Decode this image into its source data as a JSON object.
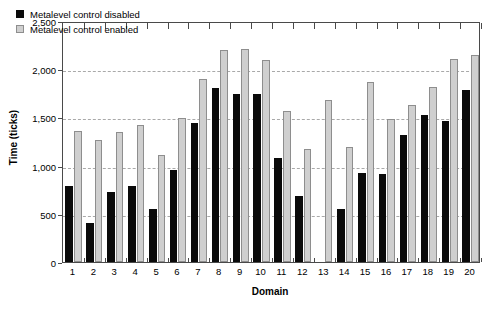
{
  "chart_data": {
    "type": "bar",
    "title": "",
    "xlabel": "Domain",
    "ylabel": "Time (ticks)",
    "categories": [
      "1",
      "2",
      "3",
      "4",
      "5",
      "6",
      "7",
      "8",
      "9",
      "10",
      "11",
      "12",
      "13",
      "14",
      "15",
      "16",
      "17",
      "18",
      "19",
      "20"
    ],
    "ylim": [
      0,
      2500
    ],
    "yticks": [
      0,
      500,
      1000,
      1500,
      2000,
      2500
    ],
    "ytick_labels": [
      "0",
      "500",
      "1,000",
      "1,500",
      "2,000",
      "2,500"
    ],
    "grid": "horizontal-dashed",
    "legend_position": "top-left-inside",
    "series": [
      {
        "name": "Metalevel control disabled",
        "color": "#0a0a0a",
        "values": [
          790,
          400,
          725,
          790,
          545,
          955,
          1440,
          1800,
          1745,
          1740,
          1075,
          680,
          0,
          550,
          920,
          910,
          1320,
          1530,
          1460,
          1780
        ]
      },
      {
        "name": "Metalevel control enabled",
        "color": "#cfcfcf",
        "values": [
          1360,
          1265,
          1345,
          1420,
          1110,
          1490,
          1900,
          2195,
          2205,
          2095,
          1570,
          1175,
          1685,
          1195,
          1870,
          1480,
          1630,
          1815,
          2105,
          2145
        ]
      }
    ]
  },
  "legend": {
    "items": [
      {
        "label": "Metalevel control disabled",
        "swatch": "black-square-swatch"
      },
      {
        "label": "Metalevel control enabled",
        "swatch": "gray-square-swatch"
      }
    ]
  },
  "axes": {
    "y_title": "Time (ticks)",
    "x_title": "Domain"
  }
}
